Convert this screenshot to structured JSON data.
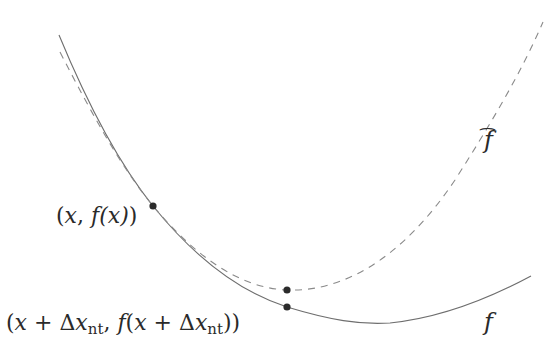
{
  "figure": {
    "curves": [
      {
        "name": "f",
        "style": "solid",
        "color": "#6e6e6e"
      },
      {
        "name": "f_hat",
        "style": "dashed",
        "color": "#8a8a8a"
      }
    ],
    "points": [
      {
        "name": "current-point",
        "x": 153,
        "y": 206
      },
      {
        "name": "newton-point-on-fhat",
        "x": 287,
        "y": 290
      },
      {
        "name": "newton-point-on-f",
        "x": 287,
        "y": 307
      }
    ],
    "labels": {
      "current_point": {
        "open": "(",
        "x": "x",
        "sep": ", ",
        "f": "f",
        "arg": "(x)",
        "close": ")"
      },
      "newton_point": {
        "open": "(",
        "x": "x",
        "plus": " + Δ",
        "x2": "x",
        "sub": "nt",
        "sep": ", ",
        "f": "f",
        "arg_open": "(",
        "x3": "x",
        "plus2": " + Δ",
        "x4": "x",
        "sub2": "nt",
        "close": "))"
      },
      "fhat": {
        "symbol": "f",
        "hat": "⌢"
      },
      "f": {
        "symbol": "f"
      }
    },
    "dot_color": "#2b2b2b"
  }
}
